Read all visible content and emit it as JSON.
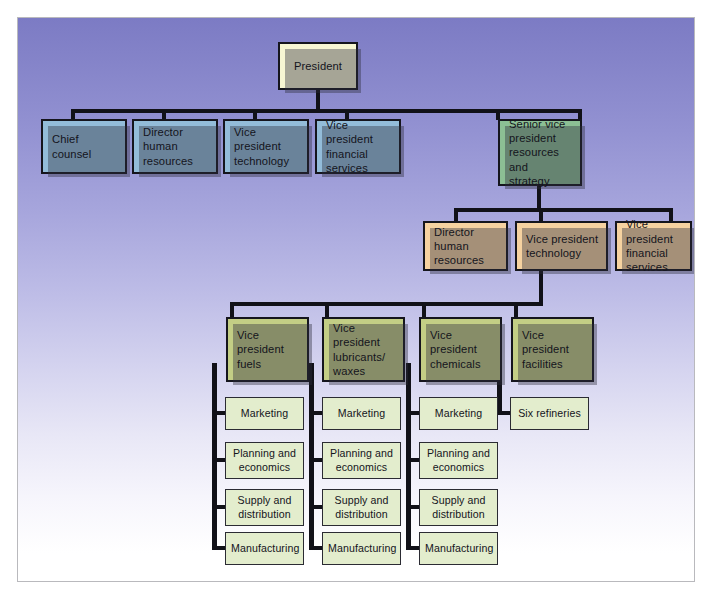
{
  "chart": {
    "type": "org-chart",
    "colors": {
      "background_top": "#7c7bc4",
      "background_bottom": "#ffffff",
      "president": "#f7f6d2",
      "executive_staff": "#93bcd9",
      "senior_vice_president": "#8cbf94",
      "resources_staff": "#f6d2a0",
      "business_unit": "#c3ce85",
      "function": "#e3edcd",
      "line": "#111118",
      "frame_border": "#b9b9bd"
    },
    "nodes": {
      "president": "President",
      "exec_staff": [
        "Chief\ncounsel",
        "Director\nhuman\nresources",
        "Vice\npresident\ntechnology",
        "Vice president\nfinancial\nservices"
      ],
      "senior_vp": "Senior vice\npresident\nresources and\nstrategy",
      "resources_staff": [
        "Director\nhuman\nresources",
        "Vice president\ntechnology",
        "Vice president\nfinancial\nservices"
      ],
      "business_units": [
        {
          "head": "Vice president\nfuels",
          "functions": [
            "Marketing",
            "Planning and\neconomics",
            "Supply and\ndistribution",
            "Manufacturing"
          ]
        },
        {
          "head": "Vice president\nlubricants/\nwaxes",
          "functions": [
            "Marketing",
            "Planning and\neconomics",
            "Supply and\ndistribution",
            "Manufacturing"
          ]
        },
        {
          "head": "Vice president\nchemicals",
          "functions": [
            "Marketing",
            "Planning and\neconomics",
            "Supply and\ndistribution",
            "Manufacturing"
          ]
        },
        {
          "head": "Vice president\nfacilities",
          "functions": [
            "Six refineries"
          ]
        }
      ]
    }
  }
}
